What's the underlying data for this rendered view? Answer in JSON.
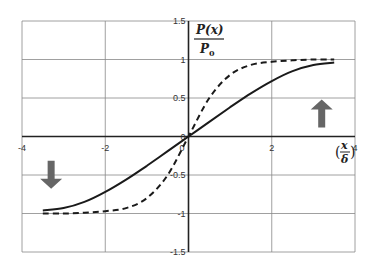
{
  "chart_data": {
    "type": "line",
    "title": "",
    "xlabel": "(x/δ)",
    "ylabel": "P(x)/P0",
    "xlim": [
      -4,
      4
    ],
    "ylim": [
      -1.5,
      1.5
    ],
    "grid": true,
    "legend": null,
    "x_ticks": [
      "-4",
      "-2",
      "0",
      "2",
      "4"
    ],
    "y_ticks": [
      "1.5",
      "1",
      "0.5",
      "0",
      "-0.5",
      "-1",
      "-1.5"
    ],
    "series": [
      {
        "name": "solid",
        "style": "solid",
        "x": [
          -3.5,
          -3,
          -2.5,
          -2,
          -1.5,
          -1,
          -0.5,
          0,
          0.5,
          1,
          1.5,
          2,
          2.5,
          3,
          3.5
        ],
        "values": [
          -0.96,
          -0.93,
          -0.85,
          -0.72,
          -0.56,
          -0.38,
          -0.19,
          0,
          0.19,
          0.38,
          0.56,
          0.72,
          0.85,
          0.93,
          0.96
        ]
      },
      {
        "name": "dashed",
        "style": "dashed",
        "x": [
          -3.5,
          -3,
          -2.5,
          -2,
          -1.5,
          -1,
          -0.5,
          0,
          0.5,
          1,
          1.5,
          2,
          2.5,
          3,
          3.5
        ],
        "values": [
          -1.0,
          -1.0,
          -0.99,
          -0.97,
          -0.93,
          -0.8,
          -0.5,
          0,
          0.5,
          0.8,
          0.93,
          0.97,
          0.99,
          1.0,
          1.0
        ]
      }
    ],
    "annotations": [
      {
        "type": "arrow-down",
        "x": -3.3,
        "y": -0.55
      },
      {
        "type": "arrow-up",
        "x": 3.2,
        "y": 0.35
      }
    ]
  },
  "labels": {
    "ylabel_num": "P(x)",
    "ylabel_den": "P",
    "ylabel_den_sub": "0",
    "xlabel_num": "x",
    "xlabel_den": "δ"
  }
}
